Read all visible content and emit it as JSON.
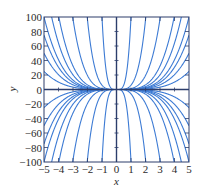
{
  "chart_data": {
    "type": "line",
    "title": "",
    "xlabel": "x",
    "ylabel": "y",
    "xlim": [
      -5,
      5
    ],
    "ylim": [
      -100,
      100
    ],
    "grid": false,
    "legend": null,
    "x_ticks": [
      -5,
      -4,
      -3,
      -2,
      -1,
      0,
      1,
      2,
      3,
      4,
      5
    ],
    "x_tick_labels": [
      "−5",
      "−4",
      "−3",
      "−2",
      "−1",
      "0",
      "1",
      "2",
      "3",
      "4",
      "5"
    ],
    "y_ticks": [
      100,
      80,
      60,
      40,
      20,
      0,
      -20,
      -40,
      -60,
      -80,
      -100
    ],
    "y_tick_labels": [
      "100",
      "80",
      "60",
      "40",
      "20",
      "0",
      "−20",
      "−40",
      "−60",
      "−80",
      "−100"
    ],
    "family": "y = C*x^4",
    "series": [
      {
        "name": "C=0.04",
        "C": 0.04
      },
      {
        "name": "C=0.08",
        "C": 0.08
      },
      {
        "name": "C=0.12",
        "C": 0.12
      },
      {
        "name": "C=0.16",
        "C": 0.16
      },
      {
        "name": "C=0.25",
        "C": 0.25
      },
      {
        "name": "C=0.4",
        "C": 0.4
      },
      {
        "name": "C=1.2",
        "C": 1.2
      },
      {
        "name": "C=6",
        "C": 6
      },
      {
        "name": "C=100",
        "C": 100
      },
      {
        "name": "C=-0.04",
        "C": -0.04
      },
      {
        "name": "C=-0.08",
        "C": -0.08
      },
      {
        "name": "C=-0.12",
        "C": -0.12
      },
      {
        "name": "C=-0.16",
        "C": -0.16
      },
      {
        "name": "C=-0.25",
        "C": -0.25
      },
      {
        "name": "C=-0.4",
        "C": -0.4
      },
      {
        "name": "C=-1.2",
        "C": -1.2
      },
      {
        "name": "C=-6",
        "C": -6
      },
      {
        "name": "C=-100",
        "C": -100
      }
    ],
    "colors": {
      "curve": "#3d7bd4",
      "axis": "#2c3d6b",
      "frame": "#2c3d6b",
      "text": "#2b2b2b"
    }
  }
}
